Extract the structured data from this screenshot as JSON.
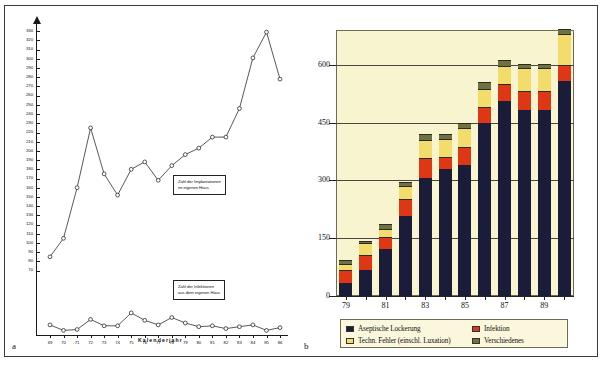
{
  "figure": {
    "panel_a_letter": "a",
    "panel_b_letter": "b"
  },
  "chart_data": [
    {
      "id": "panel_a",
      "type": "line",
      "title": "",
      "xlabel": "Kalenderjahr",
      "ylabel": "",
      "xlim": [
        68.5,
        86.5
      ],
      "ylim": [
        0,
        340
      ],
      "grid": false,
      "x": [
        "69",
        "70",
        "71",
        "72",
        "73",
        "74",
        "75",
        "76",
        "77",
        "78",
        "79",
        "80",
        "81",
        "82",
        "83",
        "84",
        "85",
        "86"
      ],
      "ytick_labels": [
        "330",
        "320",
        "310",
        "300",
        "290",
        "280",
        "270",
        "260",
        "250",
        "240",
        "230",
        "220",
        "210",
        "200",
        "190",
        "180",
        "170",
        "160",
        "150",
        "140",
        "130",
        "120",
        "110",
        "100",
        "90",
        "80",
        "70"
      ],
      "ytick_values": [
        330,
        320,
        310,
        300,
        290,
        280,
        270,
        260,
        250,
        240,
        230,
        220,
        210,
        200,
        190,
        180,
        170,
        160,
        150,
        140,
        130,
        120,
        110,
        100,
        90,
        80,
        70
      ],
      "annotations": [
        {
          "name": "implantations-note",
          "text_line1": "Zahl der Implantationen",
          "text_line2": "im eigenen Haus"
        },
        {
          "name": "infections-note",
          "text_line1": "Zahl der Infektionen",
          "text_line2": "aus dem eigenen Haus"
        }
      ],
      "series": [
        {
          "name": "Zahl der Implantationen im eigenen Haus",
          "values": [
            85,
            105,
            160,
            225,
            175,
            152,
            180,
            188,
            168,
            184,
            196,
            203,
            215,
            215,
            246,
            301,
            329,
            278
          ]
        },
        {
          "name": "Zahl der Infektionen aus dem eigenen Haus",
          "values": [
            11,
            5,
            6,
            17,
            10,
            10,
            24,
            16,
            11,
            19,
            13,
            9,
            10,
            7,
            9,
            11,
            5,
            8
          ]
        }
      ]
    },
    {
      "id": "panel_b",
      "type": "bar",
      "stacked": true,
      "title": "",
      "xlabel": "",
      "ylabel": "",
      "ylim": [
        0,
        690
      ],
      "ytick_values": [
        0,
        150,
        300,
        450,
        600
      ],
      "ytick_labels": [
        "0",
        "150",
        "300",
        "450",
        "600"
      ],
      "grid": true,
      "legend_position": "bottom",
      "categories": [
        "79",
        "80",
        "81",
        "82",
        "83",
        "84",
        "85",
        "86",
        "87",
        "88",
        "89",
        "90"
      ],
      "xtick_labels": [
        "79",
        "",
        "81",
        "",
        "83",
        "",
        "85",
        "",
        "87",
        "",
        "89",
        ""
      ],
      "series": [
        {
          "name": "Aseptische Lockerung",
          "color": "#1b1c3a",
          "values": [
            36,
            72,
            126,
            213,
            312,
            336,
            345,
            456,
            513,
            489,
            489,
            564
          ]
        },
        {
          "name": "Infektion",
          "color": "#de3715",
          "values": [
            36,
            39,
            30,
            42,
            51,
            30,
            45,
            39,
            42,
            48,
            48,
            39
          ]
        },
        {
          "name": "Techn. Fehler (einschl. Luxation)",
          "color": "#f2dc6b",
          "values": [
            12,
            30,
            21,
            33,
            45,
            45,
            48,
            45,
            45,
            57,
            57,
            78
          ]
        },
        {
          "name": "Verschiedenes",
          "color": "#6e7241",
          "values": [
            9,
            3,
            9,
            9,
            12,
            9,
            12,
            15,
            12,
            9,
            9,
            12
          ]
        }
      ]
    }
  ]
}
